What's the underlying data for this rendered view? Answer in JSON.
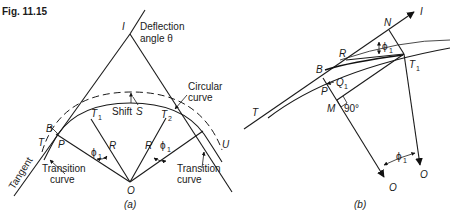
{
  "figure": {
    "title": "Fig. 11.15"
  },
  "panel_a": {
    "caption": "(a)",
    "intersection_label": "I",
    "deflection_text_line1": "Deflection",
    "deflection_text_line2": "angle θ",
    "circular_curve_line1": "Circular",
    "circular_curve_line2": "curve",
    "shift_label": "Shift",
    "shift_symbol": "S",
    "points": {
      "B": "B",
      "T": "T",
      "P": "P",
      "T1": "T",
      "T1_sub": "1",
      "T2": "T",
      "T2_sub": "2",
      "O": "O",
      "U": "U"
    },
    "radius_left": "R",
    "radius_right": "R",
    "phi_left": "ϕ",
    "phi_left_sub": "1",
    "phi_right": "ϕ",
    "phi_right_sub": "1",
    "tangent_label": "Tangent",
    "transition_left_line1": "Transition",
    "transition_left_line2": "curve",
    "transition_right_line1": "Transition",
    "transition_right_line2": "curve"
  },
  "panel_b": {
    "caption": "(b)",
    "points": {
      "I": "I",
      "N": "N",
      "R": "R",
      "B": "B",
      "T1": "T",
      "T1_sub": "1",
      "Q1": "Q",
      "Q1_sub": "1",
      "P": "P",
      "M": "M",
      "T": "T",
      "O_left": "O",
      "O_right": "O"
    },
    "right_angle_label": "90°",
    "phi_top": "ϕ",
    "phi_top_sub": "1",
    "phi_bottom": "ϕ",
    "phi_bottom_sub": "1"
  }
}
